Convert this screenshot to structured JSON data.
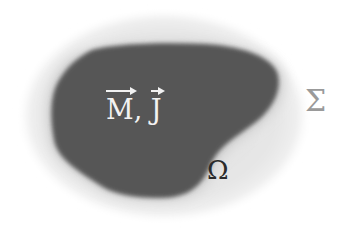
{
  "diagram": {
    "outer_region": {
      "symbol": "Σ",
      "fill": "#e6e6e6",
      "label_color": "#9a9a9a"
    },
    "inner_region": {
      "symbol": "Ω",
      "fill": "#555555",
      "label_color": "#2b2b2b"
    },
    "sources_label": {
      "vector_1": "M",
      "separator": ",",
      "vector_2": "J",
      "color": "#f2f2f2"
    }
  }
}
